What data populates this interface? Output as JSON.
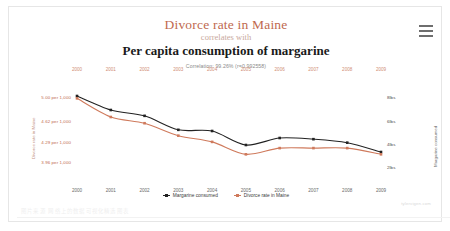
{
  "menu": {
    "icon": "hamburger-menu-icon"
  },
  "titles": {
    "primary": "Divorce rate in Maine",
    "connector": "correlates with",
    "secondary": "Per capita consumption of margarine",
    "correlation": "Correlation: 99.26% (r=0.992558)"
  },
  "legend": [
    {
      "label": "Margarine consumed",
      "color": "#222222"
    },
    {
      "label": "Divorce rate in Maine",
      "color": "#cf7a5c"
    }
  ],
  "attribution": "tylervigen.com",
  "watermark": "图片来源 网络上的数据可视化精选图表",
  "chart_data": {
    "type": "line",
    "title": "Divorce rate in Maine correlates with Per capita consumption of margarine",
    "subtitle": "Correlation: 99.26% (r=0.992558)",
    "x": [
      "2000",
      "2001",
      "2002",
      "2003",
      "2004",
      "2005",
      "2006",
      "2007",
      "2008",
      "2009"
    ],
    "xlabel": "",
    "grid": false,
    "legend_position": "bottom",
    "axes": {
      "left": {
        "label": "Divorce rate in Maine",
        "color": "#c0694f",
        "ticks": [
          "5.00 per 1,000",
          "4.62 per 1,000",
          "4.29 per 1,000",
          "3.96 per 1,000"
        ],
        "tick_values": [
          5.0,
          4.62,
          4.29,
          3.96
        ],
        "range": [
          3.8,
          5.15
        ]
      },
      "right": {
        "label": "Margarine consumed",
        "color": "#4a4a4a",
        "ticks": [
          "8lbs",
          "6lbs",
          "4lbs",
          "2lbs"
        ],
        "tick_values": [
          8,
          6,
          4,
          2
        ],
        "range": [
          1.6,
          8.8
        ]
      }
    },
    "series": [
      {
        "name": "Margarine consumed",
        "color": "#222222",
        "axis": "right",
        "unit": "lbs",
        "values": [
          8.2,
          7.0,
          6.5,
          5.3,
          5.2,
          4.0,
          4.6,
          4.5,
          4.2,
          3.4
        ]
      },
      {
        "name": "Divorce rate in Maine",
        "color": "#cf7a5c",
        "axis": "left",
        "unit": "per 1,000",
        "values": [
          5.0,
          4.7,
          4.6,
          4.4,
          4.3,
          4.1,
          4.2,
          4.2,
          4.2,
          4.1
        ]
      }
    ]
  }
}
